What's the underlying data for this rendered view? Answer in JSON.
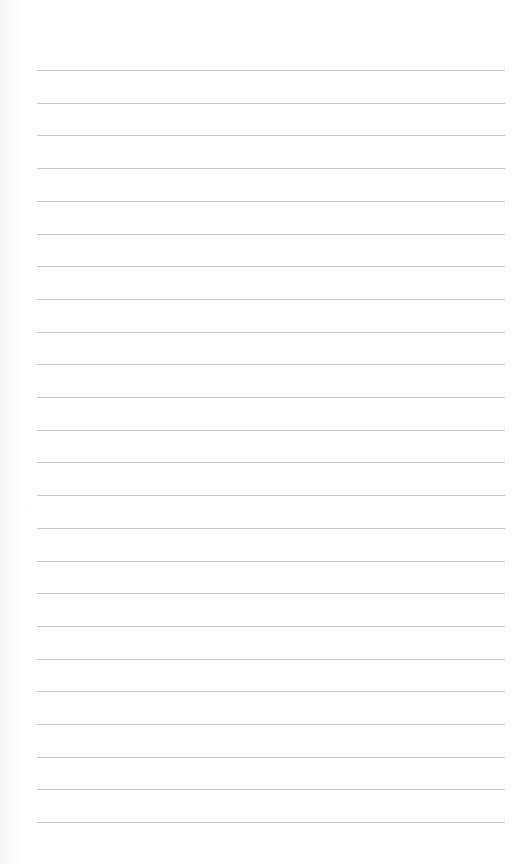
{
  "page": {
    "type": "lined-paper",
    "background_color": "#ffffff",
    "line_color": "#c8c8c8",
    "line_count": 24,
    "first_line_y": 70,
    "line_spacing": 32.7,
    "line_left": 37,
    "line_right": 505
  }
}
